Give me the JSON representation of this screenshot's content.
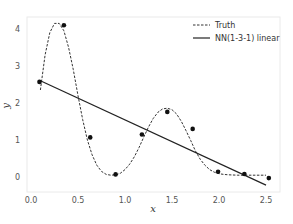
{
  "chart_data": {
    "type": "line",
    "title": "",
    "xlabel": "x",
    "ylabel": "y",
    "xlim": [
      -0.04,
      2.6
    ],
    "ylim": [
      -0.4,
      4.3
    ],
    "xticks": [
      0.0,
      0.5,
      1.0,
      1.5,
      2.0,
      2.5
    ],
    "xtick_labels": [
      "0.0",
      "0.5",
      "1.0",
      "1.5",
      "2.0",
      "2.5"
    ],
    "yticks": [
      0,
      1,
      2,
      3,
      4
    ],
    "ytick_labels": [
      "0",
      "1",
      "2",
      "3",
      "4"
    ],
    "grid": false,
    "legend_position": "upper right",
    "series": [
      {
        "name": "Truth",
        "style": "dashed",
        "color": "#333333",
        "x": [
          0.1,
          0.15,
          0.2,
          0.25,
          0.3,
          0.35,
          0.4,
          0.45,
          0.5,
          0.55,
          0.6,
          0.65,
          0.7,
          0.75,
          0.8,
          0.85,
          0.9,
          0.95,
          1.0,
          1.05,
          1.1,
          1.15,
          1.2,
          1.25,
          1.3,
          1.35,
          1.4,
          1.45,
          1.5,
          1.55,
          1.6,
          1.65,
          1.7,
          1.75,
          1.8,
          1.85,
          1.9,
          1.95,
          2.0,
          2.05,
          2.1,
          2.2,
          2.3,
          2.4,
          2.5
        ],
        "y": [
          2.35,
          3.3,
          3.9,
          4.15,
          4.15,
          3.95,
          3.5,
          2.9,
          2.2,
          1.55,
          1.0,
          0.6,
          0.32,
          0.15,
          0.07,
          0.05,
          0.06,
          0.1,
          0.2,
          0.35,
          0.55,
          0.8,
          1.08,
          1.35,
          1.58,
          1.75,
          1.84,
          1.86,
          1.82,
          1.7,
          1.5,
          1.25,
          0.98,
          0.7,
          0.48,
          0.32,
          0.2,
          0.13,
          0.09,
          0.07,
          0.06,
          0.05,
          0.05,
          0.05,
          0.05
        ]
      },
      {
        "name": "NN(1-3-1) linear",
        "style": "solid",
        "color": "#222222",
        "x": [
          0.1,
          2.5
        ],
        "y": [
          2.6,
          -0.22
        ]
      },
      {
        "name": "data",
        "style": "markers",
        "color": "#111111",
        "x": [
          0.09,
          0.35,
          0.63,
          0.9,
          1.18,
          1.45,
          1.72,
          1.99,
          2.27,
          2.53
        ],
        "y": [
          2.57,
          4.1,
          1.07,
          0.07,
          1.15,
          1.76,
          1.3,
          0.14,
          0.08,
          -0.03
        ]
      }
    ],
    "legend": [
      {
        "label": "Truth",
        "style": "dashed"
      },
      {
        "label": "NN(1-3-1) linear",
        "style": "solid"
      }
    ]
  }
}
